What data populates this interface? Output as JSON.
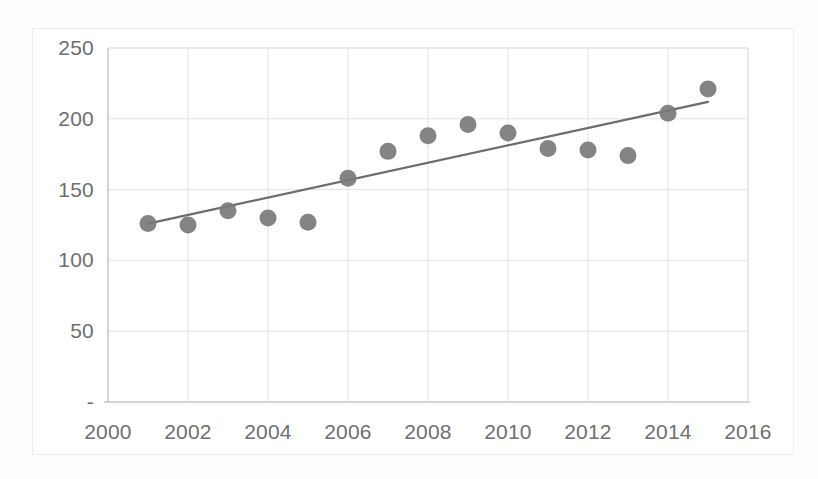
{
  "chart_data": {
    "type": "scatter",
    "title": "",
    "subtitle": "",
    "xlabel": "",
    "ylabel": "",
    "x": [
      2001,
      2002,
      2003,
      2004,
      2005,
      2006,
      2007,
      2008,
      2009,
      2010,
      2011,
      2012,
      2013,
      2014,
      2015
    ],
    "values": [
      126,
      125,
      135,
      130,
      127,
      158,
      177,
      188,
      196,
      190,
      179,
      178,
      174,
      204,
      221
    ],
    "series": [
      {
        "name": "data-points",
        "values": [
          126,
          125,
          135,
          130,
          127,
          158,
          177,
          188,
          196,
          190,
          179,
          178,
          174,
          204,
          221
        ],
        "marker": "circle",
        "color": "#7a7a7a"
      },
      {
        "name": "linear-trendline",
        "x": [
          2001,
          2015
        ],
        "values": [
          126,
          212
        ],
        "style": "line",
        "color": "#6b6b70"
      }
    ],
    "xlim": [
      2000,
      2016
    ],
    "ylim": [
      0,
      250
    ],
    "xticks": [
      2000,
      2002,
      2004,
      2006,
      2008,
      2010,
      2012,
      2014,
      2016
    ],
    "xtick_labels": [
      "2000",
      "2002",
      "2004",
      "2006",
      "2008",
      "2010",
      "2012",
      "2014",
      "2016"
    ],
    "yticks": [
      0,
      50,
      100,
      150,
      200,
      250
    ],
    "ytick_labels": [
      "-",
      "50",
      "100",
      "150",
      "200",
      "250"
    ],
    "grid": {
      "horizontal": true,
      "vertical": true,
      "color": "#e3e3e6"
    },
    "legend": {
      "visible": false,
      "position": "none"
    },
    "colors": {
      "marker": "#7a7a7a",
      "trendline": "#6b6b70",
      "grid": "#e3e3e6",
      "axis": "#c9c9cc",
      "tick_text": "#6f6f6f",
      "plot_background": "#ffffff",
      "frame_border": "#ededee"
    }
  },
  "axes": {
    "y_labels": [
      "250",
      "200",
      "150",
      "100",
      "50",
      "-"
    ],
    "x_labels": [
      "2000",
      "2002",
      "2004",
      "2006",
      "2008",
      "2010",
      "2012",
      "2014",
      "2016"
    ]
  }
}
